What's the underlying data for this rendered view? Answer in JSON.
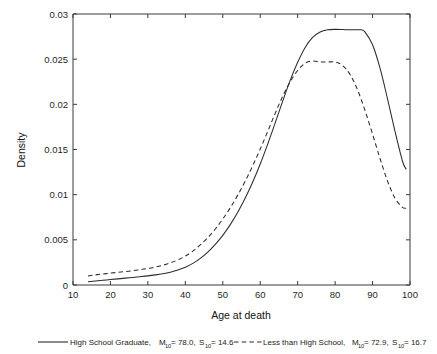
{
  "chart_data": {
    "type": "line",
    "title": "",
    "xlabel": "Age at death",
    "ylabel": "Density",
    "xlim": [
      10,
      100
    ],
    "ylim": [
      0,
      0.03
    ],
    "grid": false,
    "legend_position": "below-plot",
    "xticks": [
      10,
      20,
      30,
      40,
      50,
      60,
      70,
      80,
      90,
      100
    ],
    "xticklabels": [
      "10",
      "20",
      "30",
      "40",
      "50",
      "60",
      "70",
      "80",
      "90",
      "100"
    ],
    "yticks": [
      0,
      0.005,
      0.01,
      0.015,
      0.02,
      0.025,
      0.03
    ],
    "yticklabels": [
      "0",
      "0.005",
      "0.01",
      "0.015",
      "0.02",
      "0.025",
      "0.03"
    ],
    "series": [
      {
        "name": "High School Graduate",
        "style": "solid",
        "mean_label": "M",
        "mean_subscript": "10",
        "mean_value": "78.0",
        "sd_label": "S",
        "sd_subscript": "10",
        "sd_value": "14.6",
        "x": [
          14,
          16,
          18,
          20,
          22,
          24,
          26,
          28,
          30,
          32,
          34,
          36,
          38,
          40,
          42,
          44,
          46,
          48,
          50,
          52,
          54,
          56,
          58,
          60,
          62,
          64,
          66,
          68,
          70,
          72,
          74,
          76,
          78,
          80,
          82,
          84,
          86,
          87,
          88,
          90,
          92,
          94,
          96,
          98,
          99
        ],
        "y": [
          0.00035,
          0.00044,
          0.00052,
          0.0006,
          0.00068,
          0.00076,
          0.00084,
          0.00092,
          0.00101,
          0.00112,
          0.00125,
          0.00142,
          0.00165,
          0.00196,
          0.00239,
          0.00295,
          0.00365,
          0.0045,
          0.0055,
          0.00668,
          0.00805,
          0.00962,
          0.0114,
          0.0134,
          0.0156,
          0.01795,
          0.02035,
          0.02265,
          0.02465,
          0.0263,
          0.0274,
          0.028,
          0.02825,
          0.0283,
          0.02828,
          0.02825,
          0.02825,
          0.02825,
          0.028,
          0.0266,
          0.024,
          0.0206,
          0.017,
          0.0137,
          0.0128
        ]
      },
      {
        "name": "Less than High School",
        "style": "dashed",
        "mean_label": "M",
        "mean_subscript": "10",
        "mean_value": "72.9",
        "sd_label": "S",
        "sd_subscript": "10",
        "sd_value": "16.7",
        "x": [
          14,
          16,
          18,
          20,
          22,
          24,
          26,
          28,
          30,
          32,
          34,
          36,
          38,
          40,
          42,
          44,
          46,
          48,
          50,
          52,
          54,
          56,
          58,
          60,
          62,
          64,
          66,
          68,
          70,
          72,
          74,
          76,
          78,
          80,
          82,
          84,
          86,
          88,
          90,
          92,
          94,
          96,
          98,
          99
        ],
        "y": [
          0.001,
          0.00112,
          0.00122,
          0.00131,
          0.0014,
          0.00149,
          0.00159,
          0.0017,
          0.00183,
          0.00199,
          0.00219,
          0.00245,
          0.00278,
          0.0032,
          0.00375,
          0.00443,
          0.00525,
          0.0062,
          0.0073,
          0.00855,
          0.00995,
          0.0115,
          0.0132,
          0.01505,
          0.017,
          0.019,
          0.0209,
          0.0225,
          0.02375,
          0.02455,
          0.0248,
          0.0247,
          0.02468,
          0.0247,
          0.0243,
          0.0233,
          0.0216,
          0.0193,
          0.0167,
          0.014,
          0.0115,
          0.0096,
          0.0086,
          0.0085
        ]
      }
    ],
    "annotations": {
      "solid_peak_age": 87,
      "solid_peak_density": 0.0283,
      "dashed_peak_age": 80,
      "dashed_peak_density": 0.0247,
      "crossover_age": 76,
      "crossover_density": 0.0242
    }
  },
  "legend": {
    "items": [
      {
        "style": "solid",
        "prefix": "High School Graduate, ",
        "m_label": "M",
        "m_sub": "10",
        "m_eq": " = 78.0, ",
        "s_label": "S",
        "s_sub": "10",
        "s_eq": " = 14.6"
      },
      {
        "style": "dashed",
        "prefix": "Less than High School, ",
        "m_label": "M",
        "m_sub": "10",
        "m_eq": " = 72.9, ",
        "s_label": "S",
        "s_sub": "10",
        "s_eq": " = 16.7"
      }
    ]
  },
  "colors": {
    "line": "#2b2b2b",
    "axis": "#3a3a3a",
    "background": "#ffffff",
    "text": "#1a1a1a"
  }
}
